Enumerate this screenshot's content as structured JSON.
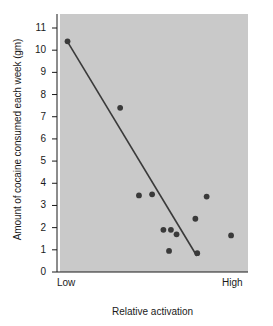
{
  "chart_data": {
    "type": "scatter",
    "title": "",
    "xlabel": "Relative activation",
    "ylabel": "Amount of cocaine consumed each week (gm)",
    "x_tick_labels": [
      "Low",
      "High"
    ],
    "y_tick_labels": [
      "0",
      "1",
      "2",
      "3",
      "4",
      "5",
      "6",
      "7",
      "8",
      "9",
      "10",
      "11"
    ],
    "y_ticks": [
      0,
      1,
      2,
      3,
      4,
      5,
      6,
      7,
      8,
      9,
      10,
      11
    ],
    "ylim": [
      0,
      11
    ],
    "xlim": [
      0,
      1
    ],
    "grid": false,
    "legend": null,
    "plot_bg_color": "#c9c9c9",
    "page_bg_color": "#ffffff",
    "marker_color": "#3a3a3a",
    "line_color": "#3a3a3a",
    "points": [
      {
        "x": 0.04,
        "y": 10.4
      },
      {
        "x": 0.32,
        "y": 7.4
      },
      {
        "x": 0.42,
        "y": 3.45
      },
      {
        "x": 0.49,
        "y": 3.5
      },
      {
        "x": 0.55,
        "y": 1.9
      },
      {
        "x": 0.59,
        "y": 1.9
      },
      {
        "x": 0.62,
        "y": 1.7
      },
      {
        "x": 0.58,
        "y": 0.95
      },
      {
        "x": 0.72,
        "y": 2.4
      },
      {
        "x": 0.78,
        "y": 3.4
      },
      {
        "x": 0.73,
        "y": 0.85
      },
      {
        "x": 0.91,
        "y": 1.65
      }
    ],
    "trend_line": {
      "x_start": 0.042,
      "y_start": 10.35,
      "x_end": 0.728,
      "y_end": 0.72
    }
  }
}
